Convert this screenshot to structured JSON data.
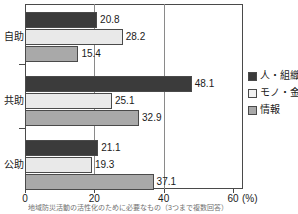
{
  "chart_data": {
    "type": "bar",
    "orientation": "horizontal",
    "title": "",
    "xlabel": "",
    "ylabel": "",
    "xlim": [
      0,
      60
    ],
    "xticks": [
      0,
      20,
      40,
      60
    ],
    "xtick_labels": [
      "0",
      "20",
      "40",
      "60"
    ],
    "x_unit": "(%)",
    "grid": true,
    "legend_position": "right",
    "categories": [
      "自助",
      "共助",
      "公助"
    ],
    "series": [
      {
        "name": "人・組織",
        "color": "#3b3b3b",
        "values": [
          20.8,
          48.1,
          21.1
        ]
      },
      {
        "name": "モノ・金",
        "color": "#e9e9e9",
        "values": [
          28.2,
          25.1,
          19.3
        ]
      },
      {
        "name": "情報",
        "color": "#a9a9a9",
        "values": [
          15.4,
          32.9,
          37.1
        ]
      }
    ],
    "value_labels": [
      [
        "20.8",
        "28.2",
        "15.4"
      ],
      [
        "48.1",
        "25.1",
        "32.9"
      ],
      [
        "21.1",
        "19.3",
        "37.1"
      ]
    ]
  },
  "axis": {
    "x_tick_labels": [
      "0",
      "20",
      "40",
      "60"
    ],
    "x_unit_label": "(%)"
  },
  "legend": {
    "items": [
      {
        "label": "人・組織"
      },
      {
        "label": "モノ・金"
      },
      {
        "label": "情報"
      }
    ]
  },
  "caption": {
    "text": "地域防災活動の活性化のために必要なもの（3つまで複数回答）"
  },
  "colors": {
    "series_1": "#3b3b3b",
    "series_2": "#e9e9e9",
    "series_3": "#a9a9a9",
    "axis": "#4a4a4a",
    "grid": "#8a8a8a",
    "text": "#1a1a1a"
  }
}
